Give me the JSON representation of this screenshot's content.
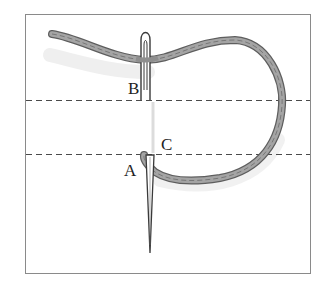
{
  "figure": {
    "type": "embroidery-stitch-diagram",
    "labels": {
      "a": "A",
      "b": "B",
      "c": "C"
    },
    "guide_lines": 2,
    "colors": {
      "frame": "#8a8a8a",
      "thread": "#9a9a9a",
      "thread_dark": "#5e5e5e",
      "needle": "#3a3a3a",
      "dashed_line": "#4a4a4a",
      "shadow": "#e4e4e4"
    }
  }
}
